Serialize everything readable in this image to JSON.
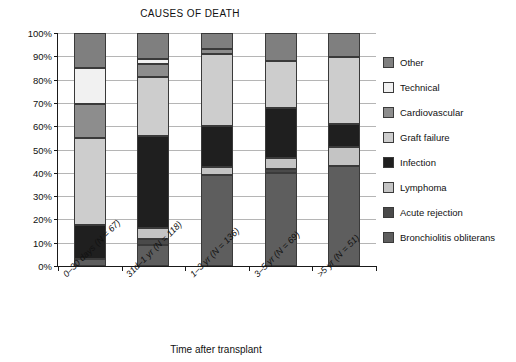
{
  "chart_data": {
    "type": "bar",
    "subtype": "stacked-100-percent",
    "title": "CAUSES OF DEATH",
    "xlabel": "Time after transplant",
    "ylabel": "Percent of patients",
    "ylim": [
      0,
      100
    ],
    "ytick_labels": [
      "0%",
      "10%",
      "20%",
      "30%",
      "40%",
      "50%",
      "60%",
      "70%",
      "80%",
      "90%",
      "100%"
    ],
    "ytick_values": [
      0,
      10,
      20,
      30,
      40,
      50,
      60,
      70,
      80,
      90,
      100
    ],
    "grid": true,
    "legend_position": "right",
    "categories": [
      "0–30 days (N = 67)",
      "31d–1 yr (N = 118)",
      "1–3 yr (N = 136)",
      "3–5 yr (N = 69)",
      ">5 yr (N = 51)"
    ],
    "series": [
      {
        "name": "Bronchiolitis obliterans",
        "color": "#5e5e5e",
        "values": [
          3,
          9,
          39,
          40,
          43
        ]
      },
      {
        "name": "Acute rejection",
        "color": "#4a4a4a",
        "values": [
          0,
          2.5,
          0,
          1.5,
          0
        ]
      },
      {
        "name": "Lymphoma",
        "color": "#c4c4c4",
        "values": [
          0,
          5,
          3.5,
          5,
          8
        ]
      },
      {
        "name": "Infection",
        "color": "#1f1f1f",
        "values": [
          14.5,
          39.5,
          17.5,
          21.5,
          10
        ]
      },
      {
        "name": "Graft failure",
        "color": "#cdcdcd",
        "values": [
          37.5,
          25,
          31,
          20,
          28.5
        ]
      },
      {
        "name": "Cardiovascular",
        "color": "#8d8d8d",
        "values": [
          14.5,
          5.5,
          2,
          0,
          0
        ]
      },
      {
        "name": "Technical",
        "color": "#f1f1f1",
        "values": [
          15.5,
          2.5,
          0,
          0,
          0
        ]
      },
      {
        "name": "Other",
        "color": "#7f7f7f",
        "values": [
          15,
          11,
          7,
          12,
          10.5
        ]
      }
    ],
    "legend_entries": [
      {
        "label": "Other",
        "color": "#7f7f7f"
      },
      {
        "label": "Technical",
        "color": "#f1f1f1"
      },
      {
        "label": "Cardiovascular",
        "color": "#8d8d8d"
      },
      {
        "label": "Graft failure",
        "color": "#cdcdcd"
      },
      {
        "label": "Infection",
        "color": "#1f1f1f"
      },
      {
        "label": "Lymphoma",
        "color": "#c4c4c4"
      },
      {
        "label": "Acute rejection",
        "color": "#4a4a4a"
      },
      {
        "label": "Bronchiolitis obliterans",
        "color": "#5e5e5e"
      }
    ]
  }
}
